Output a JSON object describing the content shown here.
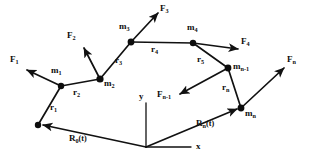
{
  "figure": {
    "name": "chain-of-masses-position-vectors-diagram",
    "stroke_color": "#111111",
    "background_color": "#ffffff",
    "node_color": "#0d0d0d"
  },
  "axes": {
    "origin": {
      "x": 146,
      "y": 147
    },
    "x_label": "x",
    "y_label": "y",
    "x_label_pos": {
      "x": 196,
      "y": 141
    },
    "y_label_pos": {
      "x": 139,
      "y": 96
    },
    "x_axis_end": {
      "x": 191,
      "y": 147
    },
    "y_axis_end": {
      "x": 146,
      "y": 103
    }
  },
  "nodes": [
    {
      "id": "base",
      "label": "",
      "x": 38,
      "y": 125,
      "r": 3.2,
      "label_x": 0,
      "label_y": 0
    },
    {
      "id": "m1",
      "label": "m",
      "sub": "1",
      "x": 61,
      "y": 86,
      "r": 3.2,
      "label_x": 51,
      "label_y": 73
    },
    {
      "id": "m2",
      "label": "m",
      "sub": "2",
      "x": 100,
      "y": 79,
      "r": 3.6,
      "label_x": 104,
      "label_y": 83
    },
    {
      "id": "m3",
      "label": "m",
      "sub": "3",
      "x": 131,
      "y": 42,
      "r": 3.4,
      "label_x": 120,
      "label_y": 28
    },
    {
      "id": "m4",
      "label": "m",
      "sub": "4",
      "x": 193,
      "y": 43,
      "r": 3.2,
      "label_x": 187,
      "label_y": 29
    },
    {
      "id": "mn1",
      "label": "m",
      "sub": "n-1",
      "x": 228,
      "y": 68,
      "r": 3.4,
      "label_x": 233,
      "label_y": 68
    },
    {
      "id": "mn",
      "label": "m",
      "sub": "n",
      "x": 241,
      "y": 108,
      "r": 3.4,
      "label_x": 245,
      "label_y": 113
    }
  ],
  "links": [
    {
      "id": "r1",
      "from": "base",
      "to": "m1",
      "label": "r",
      "sub": "1",
      "label_x": 51,
      "label_y": 108
    },
    {
      "id": "r2",
      "from": "m1",
      "to": "m2",
      "label": "r",
      "sub": "2",
      "label_x": 74,
      "label_y": 92
    },
    {
      "id": "r3",
      "from": "m2",
      "to": "m3",
      "label": "r",
      "sub": "3",
      "label_x": 116,
      "label_y": 62
    },
    {
      "id": "r4",
      "from": "m3",
      "to": "m4",
      "label": "r",
      "sub": "4",
      "label_x": 152,
      "label_y": 49
    },
    {
      "id": "r5",
      "from": "m4",
      "to": "mn1",
      "label": "r",
      "sub": "5",
      "label_x": 198,
      "label_y": 60
    },
    {
      "id": "rn",
      "from": "mn1",
      "to": "mn",
      "label": "r",
      "sub": "n",
      "label_x": 223,
      "label_y": 88
    }
  ],
  "forces": [
    {
      "id": "F1",
      "label": "F",
      "sub": "1",
      "from": {
        "x": 61,
        "y": 86
      },
      "to": {
        "x": 27,
        "y": 70
      },
      "label_x": 12,
      "label_y": 58
    },
    {
      "id": "F2",
      "label": "F",
      "sub": "2",
      "from": {
        "x": 100,
        "y": 79
      },
      "to": {
        "x": 84,
        "y": 48
      },
      "label_x": 68,
      "label_y": 34
    },
    {
      "id": "F3",
      "label": "F",
      "sub": "3",
      "from": {
        "x": 131,
        "y": 42
      },
      "to": {
        "x": 158,
        "y": 13
      },
      "label_x": 160,
      "label_y": 7
    },
    {
      "id": "F4",
      "label": "F",
      "sub": "4",
      "from": {
        "x": 193,
        "y": 43
      },
      "to": {
        "x": 238,
        "y": 49
      },
      "label_x": 241,
      "label_y": 42
    },
    {
      "id": "Fn1",
      "label": "F",
      "sub": "n-1",
      "from": {
        "x": 228,
        "y": 68
      },
      "to": {
        "x": 180,
        "y": 94
      },
      "label_x": 159,
      "label_y": 95
    },
    {
      "id": "Fn",
      "label": "F",
      "sub": "n",
      "from": {
        "x": 241,
        "y": 108
      },
      "to": {
        "x": 284,
        "y": 68
      },
      "label_x": 287,
      "label_y": 60
    }
  ],
  "reference_vectors": [
    {
      "id": "R0",
      "label": "R",
      "sub": "0",
      "suffix": "(t)",
      "from": {
        "x": 146,
        "y": 147
      },
      "to": {
        "x": 41,
        "y": 125
      },
      "label_x": 72,
      "label_y": 138
    },
    {
      "id": "Rn",
      "label": "R",
      "sub": "n",
      "suffix": "(t)",
      "from": {
        "x": 146,
        "y": 147
      },
      "to": {
        "x": 238,
        "y": 108
      },
      "label_x": 198,
      "label_y": 124
    }
  ]
}
